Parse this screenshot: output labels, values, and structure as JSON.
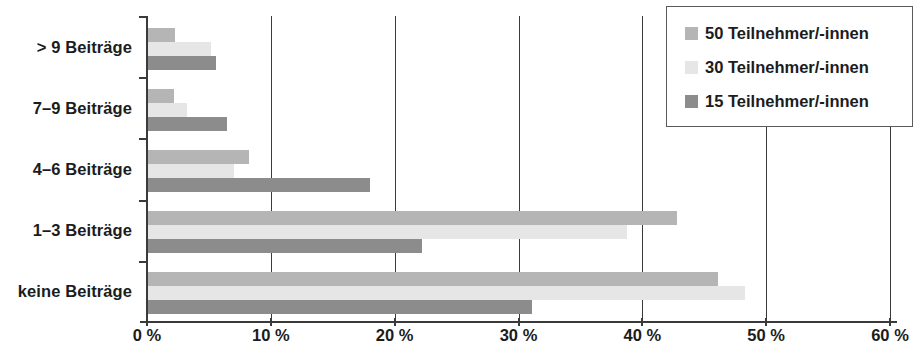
{
  "chart_data": {
    "type": "bar",
    "orientation": "horizontal",
    "title": "",
    "xlabel": "",
    "ylabel": "",
    "categories": [
      "keine Beiträge",
      "1–3 Beiträge",
      "4–6 Beiträge",
      "7–9 Beiträge",
      "> 9 Beiträge"
    ],
    "series": [
      {
        "name": "50 Teilnehmer/-innen",
        "color": "#b5b5b5",
        "values": [
          46.1,
          42.8,
          8.2,
          2.2,
          2.3
        ]
      },
      {
        "name": "30 Teilnehmer/-innen",
        "color": "#e6e6e6",
        "values": [
          48.3,
          38.8,
          7.0,
          3.2,
          5.2
        ]
      },
      {
        "name": "15 Teilnehmer/-innen",
        "color": "#8c8c8c",
        "values": [
          31.1,
          22.2,
          18.0,
          6.5,
          5.6
        ]
      }
    ],
    "xlim": [
      0,
      60
    ],
    "xticks": [
      0,
      10,
      20,
      30,
      40,
      50,
      60
    ],
    "xtick_labels": [
      "0 %",
      "10 %",
      "20 %",
      "30 %",
      "40 %",
      "50 %",
      "60 %"
    ],
    "grid": "vertical",
    "legend_position": "top-right",
    "legend_entries": [
      "50 Teilnehmer/-innen",
      "30 Teilnehmer/-innen",
      "15 Teilnehmer/-innen"
    ],
    "axis_color": "#3a3a3a",
    "background": "#ffffff"
  }
}
